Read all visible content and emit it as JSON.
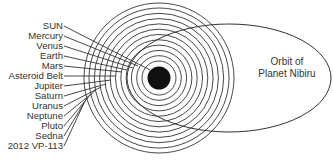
{
  "labels": [
    {
      "text": "SUN"
    },
    {
      "text": "Mercury"
    },
    {
      "text": "Venus"
    },
    {
      "text": "Earth"
    },
    {
      "text": "Mars"
    },
    {
      "text": "Asteroid Belt"
    },
    {
      "text": "Jupiter"
    },
    {
      "text": "Saturn"
    },
    {
      "text": "Uranus"
    },
    {
      "text": "Neptune"
    },
    {
      "text": "Pluto"
    },
    {
      "text": "Sedna"
    },
    {
      "text": "2012 VP-113"
    }
  ],
  "nibiru": {
    "line1": "Orbit of",
    "line2": "Planet Nibiru"
  },
  "colors": {
    "stroke": "#333333",
    "sun": "#111111"
  }
}
